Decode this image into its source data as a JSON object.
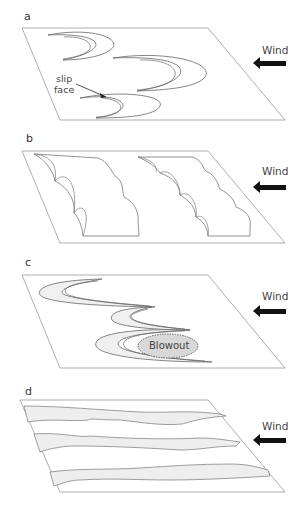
{
  "panels": [
    {
      "label": "a",
      "wind": "Wind",
      "annotation": "slip face",
      "dune_type": "barchan"
    },
    {
      "label": "b",
      "wind": "Wind",
      "dune_type": "transverse"
    },
    {
      "label": "c",
      "wind": "Wind",
      "annotation": "Blowout",
      "dune_type": "parabolic"
    },
    {
      "label": "d",
      "wind": "Wind",
      "dune_type": "longitudinal"
    }
  ],
  "annotations": {
    "slip_line1": "slip",
    "slip_line2": "face",
    "blowout": "Blowout"
  },
  "colors": {
    "outline": "#888888",
    "arrow": "#111111",
    "fill_sand": "#eeeeee",
    "blowout_fill": "#d8d8d8"
  }
}
